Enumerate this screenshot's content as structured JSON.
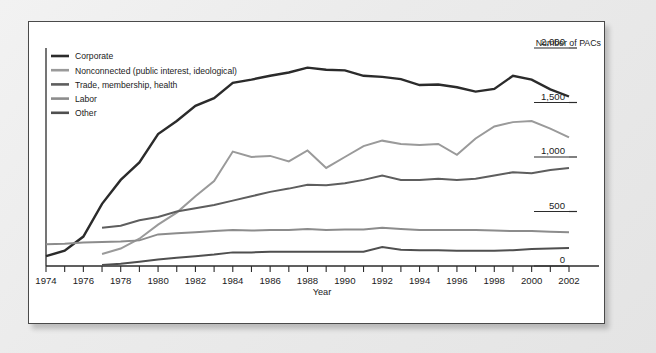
{
  "panel": {
    "background": "#ffffff",
    "border_color": "#4a4a4a"
  },
  "legend": {
    "position": "top-left",
    "items": [
      {
        "label": "Corporate",
        "color": "#2b2b2b",
        "swatch": "legend-swatch"
      },
      {
        "label": "Nonconnected (public interest, ideological)",
        "color": "#9a9a9a",
        "swatch": "legend-swatch"
      },
      {
        "label": "Trade, membership, health",
        "color": "#5e5e5e",
        "swatch": "legend-swatch"
      },
      {
        "label": "Labor",
        "color": "#8c8c8c",
        "swatch": "legend-swatch"
      },
      {
        "label": "Other",
        "color": "#4f4f4f",
        "swatch": "legend-swatch"
      }
    ]
  },
  "axes": {
    "y_title": "Number of PACs",
    "y_ticks": [
      "2,000",
      "1,500",
      "1,000",
      "500",
      "0"
    ],
    "y_tick_values": [
      2000,
      1500,
      1000,
      500,
      0
    ],
    "x_title": "Year",
    "x_ticks": [
      "1974",
      "1976",
      "1978",
      "1980",
      "1982",
      "1984",
      "1986",
      "1988",
      "1990",
      "1992",
      "1994",
      "1996",
      "1998",
      "2000",
      "2002"
    ],
    "x_tick_values": [
      1974,
      1976,
      1978,
      1980,
      1982,
      1984,
      1986,
      1988,
      1990,
      1992,
      1994,
      1996,
      1998,
      2000,
      2002
    ],
    "y_axis_side": "right",
    "grid": false
  },
  "chart_data": {
    "type": "line",
    "title": "",
    "xlabel": "Year",
    "ylabel": "Number of PACs",
    "xlim": [
      1974,
      2002
    ],
    "ylim": [
      0,
      2000
    ],
    "grid": false,
    "legend_position": "top-left",
    "x": [
      1974,
      1975,
      1976,
      1977,
      1978,
      1979,
      1980,
      1981,
      1982,
      1983,
      1984,
      1985,
      1986,
      1987,
      1988,
      1989,
      1990,
      1991,
      1992,
      1993,
      1994,
      1995,
      1996,
      1997,
      1998,
      1999,
      2000,
      2001,
      2002
    ],
    "series": [
      {
        "name": "Corporate",
        "color": "#2b2b2b",
        "values": [
          90,
          140,
          270,
          570,
          790,
          950,
          1210,
          1330,
          1470,
          1540,
          1680,
          1710,
          1745,
          1775,
          1820,
          1800,
          1795,
          1745,
          1735,
          1715,
          1660,
          1665,
          1640,
          1600,
          1625,
          1745,
          1710,
          1620,
          1555
        ]
      },
      {
        "name": "Nonconnected (public interest, ideological)",
        "color": "#9a9a9a",
        "values": [
          null,
          null,
          null,
          110,
          160,
          250,
          380,
          490,
          640,
          780,
          1050,
          1000,
          1010,
          960,
          1060,
          900,
          1000,
          1100,
          1150,
          1120,
          1110,
          1120,
          1020,
          1170,
          1280,
          1320,
          1330,
          1260,
          1180
        ]
      },
      {
        "name": "Trade, membership, health",
        "color": "#5e5e5e",
        "values": [
          null,
          null,
          null,
          350,
          370,
          420,
          450,
          500,
          530,
          560,
          600,
          640,
          680,
          710,
          745,
          740,
          760,
          790,
          830,
          790,
          790,
          800,
          790,
          800,
          830,
          860,
          850,
          880,
          900
        ]
      },
      {
        "name": "Labor",
        "color": "#8c8c8c",
        "values": [
          200,
          205,
          215,
          220,
          225,
          235,
          290,
          300,
          310,
          320,
          330,
          325,
          330,
          330,
          340,
          330,
          335,
          335,
          350,
          340,
          330,
          330,
          330,
          330,
          325,
          320,
          320,
          315,
          310
        ]
      },
      {
        "name": "Other",
        "color": "#4f4f4f",
        "values": [
          null,
          null,
          null,
          10,
          20,
          40,
          60,
          75,
          90,
          105,
          125,
          125,
          130,
          130,
          130,
          130,
          130,
          130,
          175,
          150,
          145,
          145,
          140,
          140,
          140,
          145,
          155,
          160,
          165
        ]
      }
    ]
  }
}
